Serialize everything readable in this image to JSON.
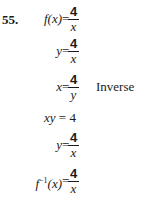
{
  "problem": {
    "number": "55.",
    "steps": [
      {
        "lhs": "f(x)",
        "eq": "=",
        "numerator": "4",
        "denominator": "x",
        "note": ""
      },
      {
        "lhs": "y",
        "eq": "=",
        "numerator": "4",
        "denominator": "x",
        "note": ""
      },
      {
        "lhs": "x",
        "eq": "=",
        "numerator": "4",
        "denominator": "y",
        "note": "Inverse"
      },
      {
        "expression": "xy = 4"
      },
      {
        "lhs": "y",
        "eq": "=",
        "numerator": "4",
        "denominator": "x",
        "note": ""
      },
      {
        "lhs_base": "f",
        "lhs_sup": "−1",
        "lhs_arg": "(x)",
        "eq": "=",
        "numerator": "4",
        "denominator": "x",
        "note": ""
      }
    ]
  }
}
